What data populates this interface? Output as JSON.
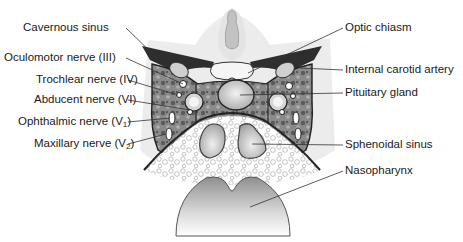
{
  "figure": {
    "labels_left": [
      {
        "id": "cavernous-sinus",
        "text": "Cavernous sinus",
        "x": 23,
        "y": 21,
        "target": [
          157,
          58
        ]
      },
      {
        "id": "oculomotor-nerve",
        "text": "Oculomotor nerve (III)",
        "x": 4,
        "y": 51,
        "target": [
          183,
          84
        ]
      },
      {
        "id": "trochlear-nerve",
        "text": "Trochlear nerve (IV)",
        "x": 36,
        "y": 73,
        "target": [
          178,
          95
        ]
      },
      {
        "id": "abducent-nerve",
        "text": "Abducent nerve (VI)",
        "x": 34,
        "y": 93,
        "target": [
          190,
          108
        ]
      },
      {
        "id": "ophthalmic-nerve",
        "text": "Ophthalmic nerve (V",
        "sub": "1",
        "close": ")",
        "x": 18,
        "y": 115,
        "target": [
          170,
          118
        ]
      },
      {
        "id": "maxillary-nerve",
        "text": "Maxillary nerve (V",
        "sub": "2",
        "close": ")",
        "x": 34,
        "y": 137,
        "target": [
          166,
          134
        ]
      }
    ],
    "labels_right": [
      {
        "id": "optic-chiasm",
        "text": "Optic chiasm",
        "x": 345,
        "y": 21,
        "target": [
          248,
          73
        ]
      },
      {
        "id": "internal-carotid-artery",
        "text": "Internal carotid artery",
        "x": 345,
        "y": 63,
        "target": [
          300,
          68
        ]
      },
      {
        "id": "pituitary-gland",
        "text": "Pituitary gland",
        "x": 345,
        "y": 86,
        "target": [
          238,
          95
        ]
      },
      {
        "id": "sphenoidal-sinus",
        "text": "Sphenoidal sinus",
        "x": 345,
        "y": 157,
        "target": [
          252,
          144
        ]
      },
      {
        "id": "nasopharynx",
        "text": "Nasopharynx",
        "x": 345,
        "y": 183,
        "target": [
          250,
          207
        ]
      }
    ],
    "colors": {
      "text": "#1a1a1a",
      "leader": "#333333",
      "dark_tissue": "#2e2e2e",
      "mid_tissue": "#7a7a7a",
      "light_tissue": "#dcdcdc",
      "background_tissue": "#ececec"
    }
  }
}
